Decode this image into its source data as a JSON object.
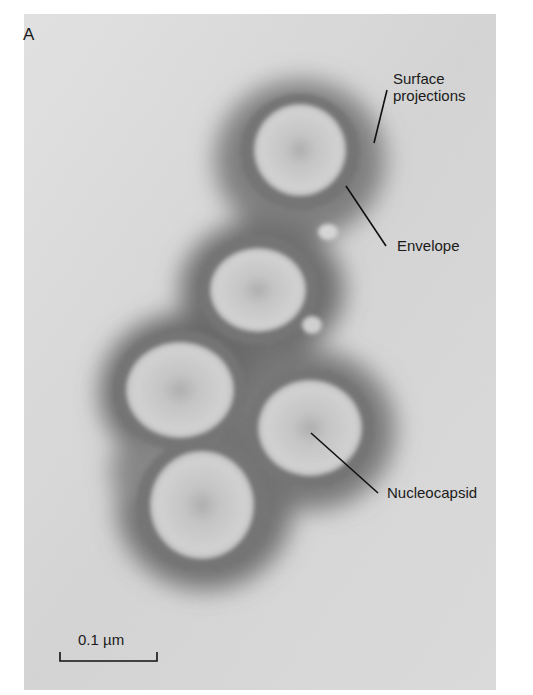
{
  "figure": {
    "panel_label": "A",
    "image_description": "Electron micrograph of five enveloped virions (negative stain)",
    "labels": [
      {
        "id": "surface-projections",
        "lines": [
          "Surface",
          "projections"
        ]
      },
      {
        "id": "envelope",
        "lines": [
          "Envelope"
        ]
      },
      {
        "id": "nucleocapsid",
        "lines": [
          "Nucleocapsid"
        ]
      }
    ],
    "scale_bar": {
      "label": "0.1 µm",
      "value": "0.1",
      "unit": "µm"
    }
  }
}
